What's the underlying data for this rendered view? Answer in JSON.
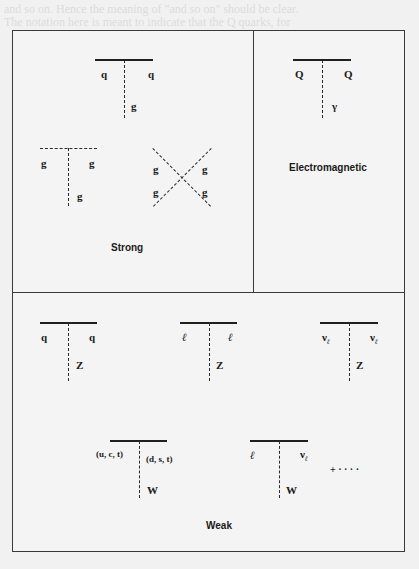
{
  "background_text": [
    "and so on. Hence the meaning of \"and so on\" should be clear.",
    "The notation here is meant to indicate that the Q quarks, for"
  ],
  "panels": {
    "strong": {
      "caption": "Strong",
      "quark_vertex": {
        "left": "q",
        "right": "q",
        "boson": "g"
      },
      "three_gluon": {
        "left": "g",
        "right": "g",
        "bottom": "g"
      },
      "four_gluon": {
        "top_left": "g",
        "top_right": "g",
        "bottom_left": "g",
        "bottom_right": "g"
      }
    },
    "electromagnetic": {
      "caption": "Electromagnetic",
      "vertex": {
        "left": "Q",
        "right": "Q",
        "boson": "γ"
      }
    },
    "weak": {
      "caption": "Weak",
      "z_vertices": [
        {
          "left": "q",
          "right": "q",
          "boson": "Z"
        },
        {
          "left": "ℓ",
          "right": "ℓ",
          "boson": "Z"
        },
        {
          "left": "ν",
          "left_sub": "ℓ",
          "right": "ν",
          "right_sub": "ℓ",
          "boson": "Z"
        }
      ],
      "w_vertices": [
        {
          "left": "(u, c, t)",
          "right": "(d, s, t)",
          "boson": "W"
        },
        {
          "left": "ℓ",
          "right": "ν",
          "right_sub": "ℓ",
          "boson": "W"
        }
      ],
      "ellipsis": "+ · · · ·"
    }
  }
}
